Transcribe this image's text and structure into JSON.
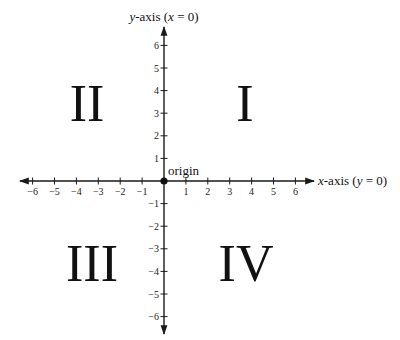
{
  "diagram": {
    "x_axis": {
      "label_var": "x",
      "label_text": "-axis (",
      "label_eq_var": "y",
      "label_eq_rest": " = 0)",
      "ticks": [
        -6,
        -5,
        -4,
        -3,
        -2,
        -1,
        1,
        2,
        3,
        4,
        5,
        6
      ],
      "tick_labels": [
        "−6",
        "−5",
        "−4",
        "−3",
        "−2",
        "−1",
        "1",
        "2",
        "3",
        "4",
        "5",
        "6"
      ]
    },
    "y_axis": {
      "label_var": "y",
      "label_text": "-axis (",
      "label_eq_var": "x",
      "label_eq_rest": " = 0)",
      "ticks": [
        6,
        5,
        4,
        3,
        2,
        1,
        -1,
        -2,
        -3,
        -4,
        -5,
        -6
      ],
      "tick_labels": [
        "6",
        "5",
        "4",
        "3",
        "2",
        "1",
        "−1",
        "−2",
        "−3",
        "−4",
        "−5",
        "−6"
      ]
    },
    "origin": {
      "label": "origin",
      "point_color": "#111111"
    },
    "quadrants": [
      {
        "id": "I",
        "label": "I",
        "x": 245,
        "y": 121
      },
      {
        "id": "II",
        "label": "II",
        "x": 87,
        "y": 121
      },
      {
        "id": "III",
        "label": "III",
        "x": 92,
        "y": 281
      },
      {
        "id": "IV",
        "label": "IV",
        "x": 246,
        "y": 281
      }
    ],
    "colors": {
      "axis": "#1a1a1a",
      "text": "#111111",
      "background": "#ffffff"
    }
  }
}
